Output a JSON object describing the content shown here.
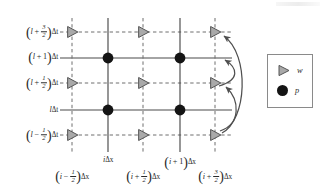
{
  "figure": {
    "type": "staggered-grid-diagram",
    "background": "#ffffff",
    "colors": {
      "solid_line": "#4a4a4a",
      "dashed_line": "#6e6e6e",
      "triangle_fill": "#a9a9a9",
      "triangle_stroke": "#555555",
      "dot_fill": "#141414",
      "arrow": "#4f4f4f",
      "legend_border": "#8a8a8a",
      "text": "#2a2a2a"
    }
  },
  "grid": {
    "solid_row_y": [
      58,
      110
    ],
    "dashed_row_y": [
      32,
      83,
      135
    ],
    "solid_col_x": [
      108,
      180
    ],
    "dashed_col_x": [
      72,
      143,
      215
    ],
    "row_left": 60,
    "row_right": 232,
    "col_top": 18,
    "col_bottom": 152
  },
  "y_axis": {
    "label_x": 58,
    "labels": [
      {
        "id": "t-plus-3-2",
        "y": 32,
        "open": "(",
        "var": "l",
        "op": "+",
        "num": "3",
        "den": "2",
        "close": ")",
        "suffix": "Δt",
        "has_fraction": true
      },
      {
        "id": "t-plus-1",
        "y": 58,
        "open": "(",
        "var": "l",
        "op": "+",
        "whole": "1",
        "close": ")",
        "suffix": "Δt",
        "has_fraction": false
      },
      {
        "id": "t-plus-1-2",
        "y": 83,
        "open": "(",
        "var": "l",
        "op": "+",
        "num": "1",
        "den": "2",
        "close": ")",
        "suffix": "Δt",
        "has_fraction": true
      },
      {
        "id": "t-l",
        "y": 110,
        "open": "",
        "var": "l",
        "op": "",
        "whole": "",
        "close": "",
        "suffix": "Δt",
        "has_fraction": false
      },
      {
        "id": "t-minus-1-2",
        "y": 135,
        "open": "(",
        "var": "l",
        "op": "−",
        "num": "1",
        "den": "2",
        "close": ")",
        "suffix": "Δt",
        "has_fraction": true
      }
    ]
  },
  "x_axis": {
    "inner_label_y": 156,
    "outer_label_y": 169,
    "labels": [
      {
        "id": "x-minus-1-2",
        "x": 72,
        "row": "outer",
        "open": "(",
        "var": "i",
        "op": "−",
        "num": "1",
        "den": "2",
        "close": ")",
        "suffix": "Δx",
        "has_fraction": true
      },
      {
        "id": "x-i",
        "x": 108,
        "row": "inner",
        "open": "",
        "var": "i",
        "op": "",
        "whole": "",
        "close": "",
        "suffix": "Δx",
        "has_fraction": false
      },
      {
        "id": "x-plus-1-2",
        "x": 143,
        "row": "outer",
        "open": "(",
        "var": "i",
        "op": "+",
        "num": "1",
        "den": "2",
        "close": ")",
        "suffix": "Δx",
        "has_fraction": true
      },
      {
        "id": "x-plus-1",
        "x": 180,
        "row": "inner",
        "open": "(",
        "var": "i",
        "op": "+",
        "whole": "1",
        "close": ")",
        "suffix": "Δx",
        "has_fraction": false
      },
      {
        "id": "x-plus-3-2",
        "x": 215,
        "row": "outer",
        "open": "(",
        "var": "i",
        "op": "+",
        "num": "3",
        "den": "2",
        "close": ")",
        "suffix": "Δx",
        "has_fraction": true
      }
    ]
  },
  "markers": {
    "triangles": [
      {
        "x": 72,
        "y": 32
      },
      {
        "x": 143,
        "y": 32
      },
      {
        "x": 215,
        "y": 32
      },
      {
        "x": 72,
        "y": 83
      },
      {
        "x": 143,
        "y": 83
      },
      {
        "x": 215,
        "y": 83
      },
      {
        "x": 72,
        "y": 135
      },
      {
        "x": 143,
        "y": 135
      },
      {
        "x": 215,
        "y": 135
      }
    ],
    "dots": [
      {
        "x": 108,
        "y": 58
      },
      {
        "x": 180,
        "y": 58
      },
      {
        "x": 108,
        "y": 110
      },
      {
        "x": 180,
        "y": 110
      }
    ],
    "triangle_size": 9.5,
    "dot_radius": 5.4
  },
  "arrows": [
    {
      "id": "arrow-to-top-triangle",
      "d": "M 222 133 C 247 120 250 55 224 36",
      "tip": {
        "x": 224,
        "y": 36
      },
      "angle": -140
    },
    {
      "id": "arrow-to-upper-mid-row",
      "d": "M 219 86 C 240 80 238 68 225 60",
      "tip": {
        "x": 225,
        "y": 60
      },
      "angle": -147
    },
    {
      "id": "arrow-to-middle-triangle",
      "d": "M 220 131 C 241 124 240 100 226 87",
      "tip": {
        "x": 226,
        "y": 87
      },
      "angle": -137
    }
  ],
  "legend": {
    "title": "",
    "items": [
      {
        "id": "legend-w",
        "symbol": "triangle",
        "label": "w"
      },
      {
        "id": "legend-p",
        "symbol": "dot",
        "label": "p"
      }
    ]
  }
}
